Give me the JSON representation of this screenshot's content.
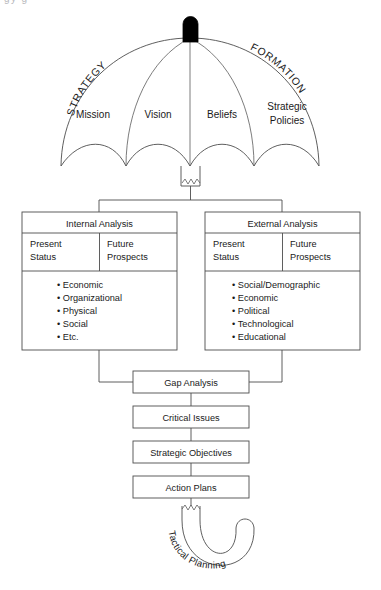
{
  "diagram": {
    "title_partial": "gy                    g",
    "umbrella": {
      "arc_left_label": "STRATEGY",
      "arc_right_label": "FORMATION",
      "panels": [
        {
          "label": "Mission"
        },
        {
          "label": "Vision"
        },
        {
          "label": "Beliefs"
        },
        {
          "label": "Strategic",
          "label2": "Policies"
        }
      ],
      "handle_label": "Tactical Planning"
    },
    "analysis": [
      {
        "title": "Internal Analysis",
        "columns": [
          {
            "line1": "Present",
            "line2": "Status"
          },
          {
            "line1": "Future",
            "line2": "Prospects"
          }
        ],
        "items": [
          "Economic",
          "Organizational",
          "Physical",
          "Social",
          "Etc."
        ]
      },
      {
        "title": "External Analysis",
        "columns": [
          {
            "line1": "Present",
            "line2": "Status"
          },
          {
            "line1": "Future",
            "line2": "Prospects"
          }
        ],
        "items": [
          "Social/Demographic",
          "Economic",
          "Political",
          "Technological",
          "Educational"
        ]
      }
    ],
    "flow": [
      {
        "label": "Gap Analysis"
      },
      {
        "label": "Critical Issues"
      },
      {
        "label": "Strategic Objectives"
      },
      {
        "label": "Action Plans"
      }
    ],
    "colors": {
      "stroke": "#4d4d4d",
      "text": "#1a1a1a",
      "knob": "#000000",
      "background": "#ffffff"
    }
  }
}
